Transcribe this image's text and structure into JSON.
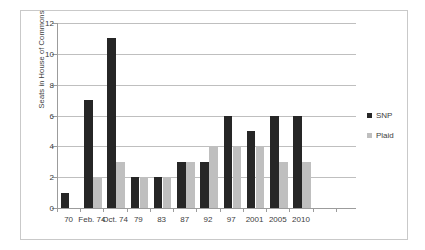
{
  "chart_data": {
    "type": "bar",
    "title": "",
    "xlabel": "",
    "ylabel": "Seats in House of Commons",
    "categories": [
      "70",
      "Feb. 74",
      "Oct. 74",
      "79",
      "83",
      "87",
      "92",
      "97",
      "2001",
      "2005",
      "2010"
    ],
    "series": [
      {
        "name": "SNP",
        "color": "#262626",
        "values": [
          1,
          7,
          11,
          2,
          2,
          3,
          3,
          6,
          5,
          6,
          6
        ]
      },
      {
        "name": "Plaid",
        "color": "#bfbfbf",
        "values": [
          0,
          2,
          3,
          2,
          2,
          3,
          4,
          4,
          4,
          3,
          3
        ]
      }
    ],
    "ylim": [
      0,
      12
    ],
    "yticks": [
      0,
      2,
      4,
      6,
      8,
      10,
      12
    ],
    "grid": true,
    "legend_position": "right"
  }
}
